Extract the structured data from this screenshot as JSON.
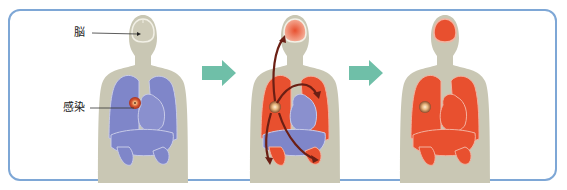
{
  "diagram": {
    "type": "infection-spread-sequence",
    "labels": {
      "brain": "脳",
      "infection": "感染"
    },
    "stages": [
      {
        "id": "stage-1",
        "description": "Localized lung infection; organs healthy (blue)"
      },
      {
        "id": "stage-2",
        "description": "Infection spreads via bloodstream to brain, lungs, liver, kidneys"
      },
      {
        "id": "stage-3",
        "description": "All organs affected (red)"
      }
    ],
    "colors": {
      "frame": "#7ea7d6",
      "body": "#c9c7b4",
      "healthy_organ": "#7f86c9",
      "affected_organ": "#e8502f",
      "infection_core": "#c2432a",
      "spread_arrow": "#6b1f14",
      "step_arrow": "#6fbfa8"
    }
  }
}
